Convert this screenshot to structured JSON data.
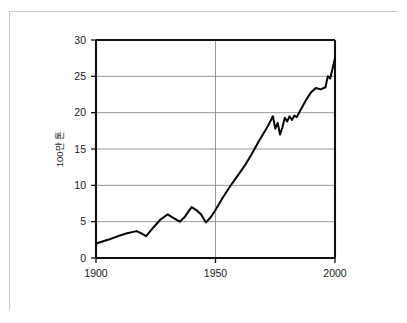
{
  "chart_data": {
    "type": "line",
    "title": "",
    "xlabel": "",
    "ylabel": "100만 톤",
    "xlim": [
      1900,
      2000
    ],
    "ylim": [
      0,
      30
    ],
    "grid": true,
    "legend": "none",
    "x_ticks": [
      "1900",
      "1950",
      "2000"
    ],
    "x_tick_values": [
      1900,
      1950,
      2000
    ],
    "y_ticks": [
      "0",
      "5",
      "10",
      "15",
      "20",
      "25",
      "30"
    ],
    "y_tick_values": [
      0,
      5,
      10,
      15,
      20,
      25,
      30
    ],
    "series": [
      {
        "name": "production",
        "color": "#050505",
        "x": [
          1900,
          1905,
          1910,
          1913,
          1917,
          1919,
          1921,
          1924,
          1927,
          1930,
          1932,
          1935,
          1937,
          1940,
          1942,
          1944,
          1946,
          1948,
          1950,
          1953,
          1956,
          1959,
          1962,
          1965,
          1968,
          1970,
          1972,
          1974,
          1975,
          1976,
          1977,
          1978,
          1979,
          1980,
          1981,
          1982,
          1983,
          1984,
          1986,
          1988,
          1990,
          1992,
          1994,
          1996,
          1997,
          1998,
          2000
        ],
        "y": [
          2.0,
          2.5,
          3.1,
          3.4,
          3.7,
          3.4,
          3.0,
          4.2,
          5.3,
          6.0,
          5.6,
          5.0,
          5.6,
          7.0,
          6.6,
          6.0,
          4.9,
          5.6,
          6.6,
          8.3,
          9.8,
          11.2,
          12.6,
          14.2,
          16.0,
          17.1,
          18.2,
          19.5,
          17.8,
          18.6,
          17.0,
          18.0,
          19.3,
          18.8,
          19.5,
          19.0,
          19.6,
          19.4,
          20.6,
          21.8,
          22.8,
          23.4,
          23.2,
          23.5,
          25.0,
          24.7,
          27.5
        ]
      }
    ]
  }
}
